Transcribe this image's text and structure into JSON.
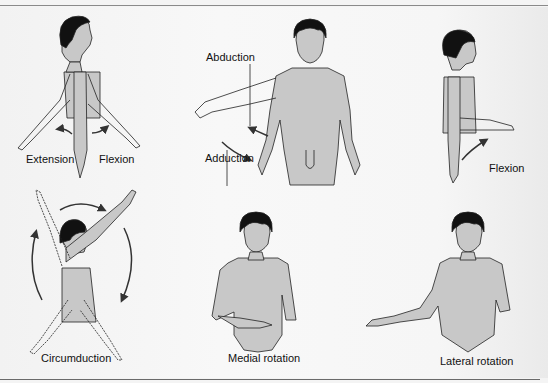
{
  "figure": {
    "panels": [
      {
        "id": "flexion-extension",
        "labels": [
          "Extension",
          "Flexion"
        ]
      },
      {
        "id": "abduction-adduction",
        "labels": [
          "Abduction",
          "Adduction"
        ]
      },
      {
        "id": "flexion-side",
        "labels": [
          "Flexion"
        ]
      },
      {
        "id": "circumduction",
        "labels": [
          "Circumduction"
        ]
      },
      {
        "id": "medial-rotation",
        "labels": [
          "Medial rotation"
        ]
      },
      {
        "id": "lateral-rotation",
        "labels": [
          "Lateral rotation"
        ]
      }
    ],
    "colors": {
      "skin": "#c8c8c8",
      "outline": "#222222",
      "hair": "#111111",
      "background": "#f4f4f4",
      "rule": "#8a8a8a"
    }
  }
}
